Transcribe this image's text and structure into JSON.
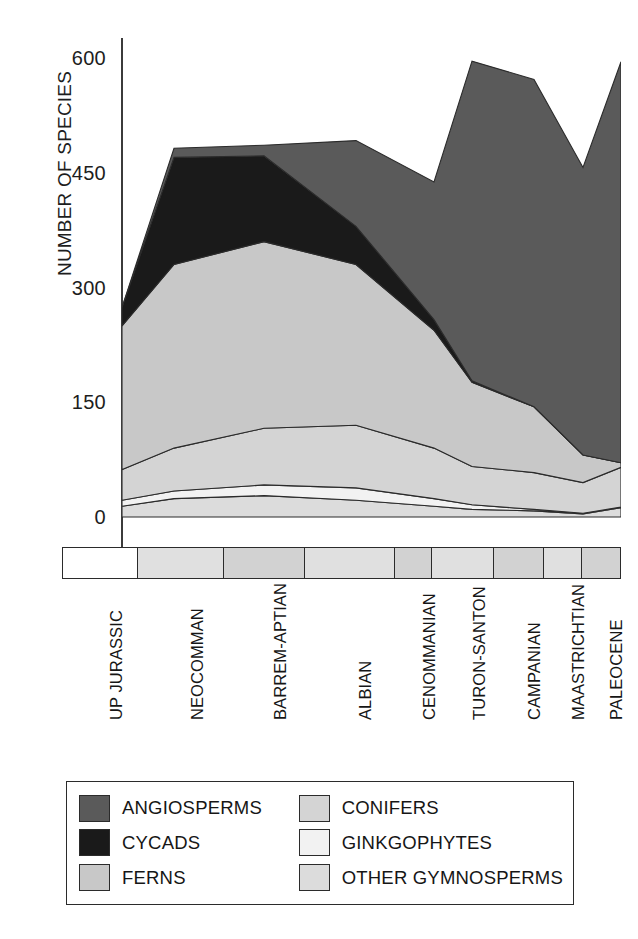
{
  "chart_data": {
    "type": "area",
    "title": "",
    "xlabel": "",
    "ylabel": "NUMBER OF SPECIES",
    "ylim": [
      0,
      660
    ],
    "yticks": [
      0,
      150,
      300,
      450,
      600
    ],
    "ytick_labels": [
      "0",
      "150",
      "300",
      "450",
      "600"
    ],
    "grid": false,
    "stacked": true,
    "legend_position": "bottom",
    "categories": [
      "UP JURASSIC",
      "NEOCOMMAN",
      "BARREM-APTIAN",
      "ALBIAN",
      "CENOMMANIAN",
      "TURON-SANTON",
      "CAMPANIAN",
      "MAASTRICHTIAN",
      "PALEOCENE"
    ],
    "series": [
      {
        "name": "OTHER GYMNOSPERMS",
        "color": "#dcdcdc",
        "values": [
          14,
          24,
          28,
          22,
          14,
          10,
          8,
          4,
          12
        ]
      },
      {
        "name": "GINKGOPHYTES",
        "color": "#f2f2f2",
        "values": [
          8,
          10,
          14,
          16,
          10,
          6,
          2,
          1,
          1
        ]
      },
      {
        "name": "CONIFERS",
        "color": "#d4d4d4",
        "values": [
          40,
          56,
          74,
          82,
          66,
          50,
          48,
          40,
          52
        ]
      },
      {
        "name": "FERNS",
        "color": "#c8c8c8",
        "values": [
          188,
          240,
          244,
          210,
          154,
          110,
          86,
          36,
          6
        ]
      },
      {
        "name": "CYCADS",
        "color": "#1a1a1a",
        "values": [
          24,
          140,
          112,
          50,
          14,
          2,
          0,
          0,
          0
        ]
      },
      {
        "name": "ANGIOSPERMS",
        "color": "#5a5a5a",
        "values": [
          0,
          12,
          14,
          112,
          180,
          418,
          428,
          376,
          524
        ]
      }
    ],
    "totals": [
      274,
      482,
      486,
      492,
      438,
      596,
      572,
      457,
      595
    ]
  },
  "axis": {
    "y_title": "NUMBER OF SPECIES",
    "ticks": [
      "600",
      "450",
      "300",
      "150",
      "0"
    ]
  },
  "periods": [
    {
      "label": "UP JURASSIC",
      "shade": "light"
    },
    {
      "label": "NEOCOMMAN",
      "shade": "mid"
    },
    {
      "label": "BARREM-APTIAN",
      "shade": "dark"
    },
    {
      "label": "ALBIAN",
      "shade": "mid"
    },
    {
      "label": "CENOMMANIAN",
      "shade": "dark"
    },
    {
      "label": "TURON-SANTON",
      "shade": "mid"
    },
    {
      "label": "CAMPANIAN",
      "shade": "dark"
    },
    {
      "label": "MAASTRICHTIAN",
      "shade": "mid"
    },
    {
      "label": "PALEOCENE",
      "shade": "dark"
    }
  ],
  "legend": {
    "items": [
      {
        "label": "ANGIOSPERMS",
        "color": "#5a5a5a"
      },
      {
        "label": "CONIFERS",
        "color": "#d4d4d4"
      },
      {
        "label": "CYCADS",
        "color": "#1a1a1a"
      },
      {
        "label": "GINKGOPHYTES",
        "color": "#f2f2f2"
      },
      {
        "label": "FERNS",
        "color": "#c8c8c8"
      },
      {
        "label": "OTHER GYMNOSPERMS",
        "color": "#dcdcdc"
      }
    ]
  }
}
